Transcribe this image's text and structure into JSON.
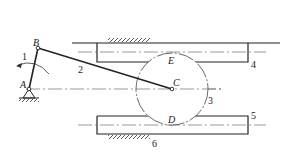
{
  "diagram": {
    "type": "mechanism-schematic",
    "points": {
      "A": {
        "label": "A",
        "x": 29,
        "y": 89
      },
      "B": {
        "label": "B",
        "x": 38,
        "y": 48
      },
      "C": {
        "label": "C",
        "x": 172,
        "y": 89
      },
      "D": {
        "label": "D"
      },
      "E": {
        "label": "E"
      }
    },
    "members": [
      {
        "id": "1",
        "label": "1",
        "name": "crank AB"
      },
      {
        "id": "2",
        "label": "2",
        "name": "connecting rod BC"
      },
      {
        "id": "3",
        "label": "3",
        "name": "gear (circle centered at C)"
      },
      {
        "id": "4",
        "label": "4",
        "name": "upper rack"
      },
      {
        "id": "5",
        "label": "5",
        "name": "lower rack"
      },
      {
        "id": "6",
        "label": "6",
        "name": "frame / ground"
      }
    ],
    "colors": {
      "line": "#222222",
      "background": "#ffffff"
    }
  }
}
